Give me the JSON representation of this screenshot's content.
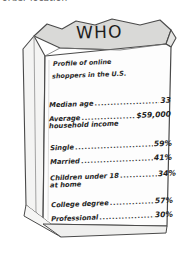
{
  "clipped_caption": "order location",
  "bag": {
    "title": "WHO",
    "subtitle_line_1": "Profile of online",
    "subtitle_line_2": "shoppers in the U.S.",
    "dot_leader": "...............................................",
    "stats": [
      {
        "label": "Median age",
        "value": "33",
        "continuation": ""
      },
      {
        "label": "Average",
        "value": "$59,000",
        "continuation": "household income"
      },
      {
        "label": "Single",
        "value": "59%",
        "continuation": ""
      },
      {
        "label": "Married",
        "value": "41%",
        "continuation": ""
      },
      {
        "label": "Children under 18",
        "value": "34%",
        "continuation": "at home"
      },
      {
        "label": "College degree",
        "value": "57%",
        "continuation": ""
      },
      {
        "label": "Professional",
        "value": "30%",
        "continuation": ""
      }
    ]
  },
  "colors": {
    "paper_front": "#fdfdfd",
    "paper_shadow": "#d8d8d6",
    "paper_side": "#f2f2f1",
    "outline": "#4a4a4a",
    "text": "#262626"
  }
}
